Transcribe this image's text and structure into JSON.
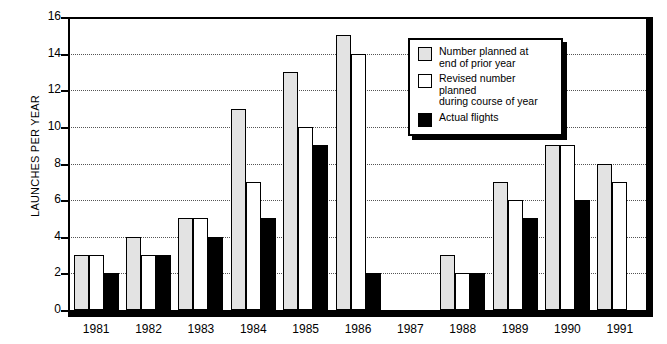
{
  "chart_data": {
    "type": "bar",
    "title": "",
    "xlabel": "",
    "ylabel": "LAUNCHES PER YEAR",
    "ylim": [
      0,
      16
    ],
    "ytick_values": [
      0,
      2,
      4,
      6,
      8,
      10,
      12,
      14,
      16
    ],
    "ytick_labels": [
      "0",
      "2",
      "4",
      "6",
      "8",
      "10",
      "12",
      "14",
      "16"
    ],
    "grid": true,
    "legend_position": "upper-right-inside",
    "categories": [
      "1981",
      "1982",
      "1983",
      "1984",
      "1985",
      "1986",
      "1987",
      "1988",
      "1989",
      "1990",
      "1991"
    ],
    "series": [
      {
        "name": "Number planned at end of prior year",
        "key": "planned",
        "color": "#e3e3e3",
        "values": [
          3,
          4,
          5,
          11,
          13,
          15,
          null,
          3,
          7,
          9,
          8
        ]
      },
      {
        "name": "Revised number planned during course of year",
        "key": "revised",
        "color": "#ffffff",
        "values": [
          3,
          3,
          5,
          7,
          10,
          14,
          null,
          2,
          6,
          9,
          7
        ]
      },
      {
        "name": "Actual flights",
        "key": "actual",
        "color": "#000000",
        "values": [
          2,
          3,
          4,
          5,
          9,
          2,
          null,
          2,
          5,
          6,
          null
        ]
      }
    ]
  },
  "legend": {
    "entries": [
      {
        "label_line1": "Number planned at",
        "label_line2": "end of prior year",
        "swatch": "planned"
      },
      {
        "label_line1": "Revised number planned",
        "label_line2": "during course of year",
        "swatch": "revised"
      },
      {
        "label_line1": "Actual flights",
        "label_line2": "",
        "swatch": "actual"
      }
    ]
  }
}
